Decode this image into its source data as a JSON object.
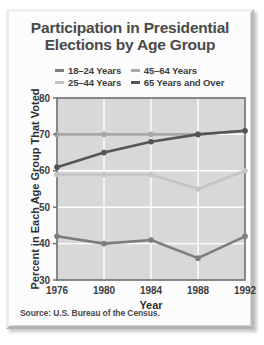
{
  "panel": {
    "title_line1": "Participation in Presidential",
    "title_line2": "Elections by Age Group",
    "source": "Source: U.S. Bureau of the Census."
  },
  "legend": {
    "position": "top-center",
    "entries": [
      {
        "label": "18–24 Years",
        "color": "#7d7d7d"
      },
      {
        "label": "45–64 Years",
        "color": "#a8a8a8"
      },
      {
        "label": "25–44 Years",
        "color": "#c4c4c4"
      },
      {
        "label": "65 Years and Over",
        "color": "#555555"
      }
    ]
  },
  "chart_data": {
    "type": "line",
    "title": "Participation in Presidential Elections by Age Group",
    "xlabel": "Year",
    "ylabel": "Percent in Each Age Group That Voted",
    "x": [
      1976,
      1980,
      1984,
      1988,
      1992
    ],
    "xticklabels": [
      "1976",
      "1980",
      "1984",
      "1988",
      "1992"
    ],
    "ylim": [
      30,
      80
    ],
    "yticks": [
      30,
      40,
      50,
      60,
      70,
      80
    ],
    "yticklabels": [
      "30",
      "40",
      "50",
      "60",
      "70",
      "80"
    ],
    "grid": true,
    "grid_color": "#ffffff",
    "plot_background": "#d8d8d8",
    "series": [
      {
        "name": "18–24 Years",
        "color": "#7d7d7d",
        "values": [
          42,
          40,
          41,
          36,
          42
        ]
      },
      {
        "name": "25–44 Years",
        "color": "#c4c4c4",
        "values": [
          59,
          59,
          59,
          55,
          60
        ]
      },
      {
        "name": "45–64 Years",
        "color": "#a8a8a8",
        "values": [
          70,
          70,
          70,
          70,
          71
        ]
      },
      {
        "name": "65 Years and Over",
        "color": "#555555",
        "values": [
          61,
          65,
          68,
          70,
          71
        ]
      }
    ]
  }
}
